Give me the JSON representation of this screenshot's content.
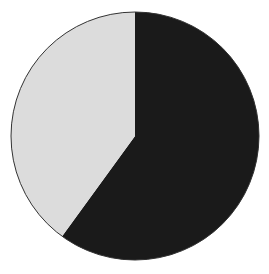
{
  "chart_data": {
    "type": "pie",
    "title": "",
    "categories": [
      "Dark segment",
      "Light segment"
    ],
    "values": [
      60,
      40
    ],
    "colors": [
      "#1a1a1a",
      "#dcdcdc"
    ],
    "start_angle": "12 o'clock",
    "direction": "clockwise",
    "legend": "none",
    "labels": "none"
  }
}
